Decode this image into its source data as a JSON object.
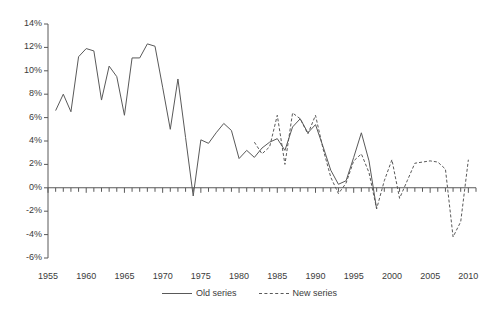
{
  "chart_data": {
    "type": "line",
    "title": "",
    "subtitle": "",
    "xlabel": "",
    "ylabel": "",
    "grid": false,
    "legend_position": "bottom-center",
    "xlim": [
      1955,
      2011
    ],
    "ylim": [
      -6,
      14
    ],
    "y_tick_labels": [
      "14%",
      "12%",
      "10%",
      "8%",
      "6%",
      "4%",
      "2%",
      "0%",
      "-2%",
      "-4%",
      "-6%"
    ],
    "y_tick_values": [
      14,
      12,
      10,
      8,
      6,
      4,
      2,
      0,
      -2,
      -4,
      -6
    ],
    "x_tick_labels": [
      "1955",
      "1960",
      "1965",
      "1970",
      "1975",
      "1980",
      "1985",
      "1990",
      "1995",
      "2000",
      "2005",
      "2010"
    ],
    "x_tick_values": [
      1955,
      1960,
      1965,
      1970,
      1975,
      1980,
      1985,
      1990,
      1995,
      2000,
      2005,
      2010
    ],
    "x_minor_tick_interval": 1,
    "series": [
      {
        "name": "Old series",
        "style": "solid",
        "color": "#595959",
        "x": [
          1956,
          1957,
          1958,
          1959,
          1960,
          1961,
          1962,
          1963,
          1964,
          1965,
          1966,
          1967,
          1968,
          1969,
          1970,
          1971,
          1972,
          1973,
          1974,
          1975,
          1976,
          1977,
          1978,
          1979,
          1980,
          1981,
          1982,
          1983,
          1984,
          1985,
          1986,
          1987,
          1988,
          1989,
          1990,
          1991,
          1992,
          1993,
          1994,
          1995,
          1996,
          1997,
          1998
        ],
        "values": [
          6.6,
          8.0,
          6.5,
          11.2,
          11.9,
          11.7,
          7.5,
          10.4,
          9.5,
          6.2,
          11.1,
          11.1,
          12.3,
          12.1,
          8.6,
          5.0,
          9.3,
          4.3,
          -0.7,
          4.1,
          3.8,
          4.7,
          5.5,
          4.9,
          2.5,
          3.2,
          2.6,
          3.4,
          3.9,
          4.2,
          3.2,
          5.2,
          5.9,
          4.7,
          5.4,
          3.5,
          1.5,
          0.3,
          0.6,
          2.6,
          4.7,
          2.3,
          -1.8
        ]
      },
      {
        "name": "New series",
        "style": "dashed",
        "color": "#595959",
        "x": [
          1982,
          1983,
          1984,
          1985,
          1986,
          1987,
          1988,
          1989,
          1990,
          1991,
          1992,
          1993,
          1994,
          1995,
          1996,
          1997,
          1998,
          1999,
          2000,
          2001,
          2002,
          2003,
          2004,
          2005,
          2006,
          2007,
          2008,
          2009,
          2010
        ],
        "values": [
          3.9,
          2.9,
          3.5,
          6.2,
          2.0,
          6.4,
          5.9,
          4.6,
          6.2,
          3.3,
          0.9,
          -0.5,
          0.4,
          2.3,
          2.9,
          1.3,
          -1.8,
          0.6,
          2.4,
          -0.9,
          0.6,
          2.1,
          2.2,
          2.3,
          2.2,
          1.6,
          -4.2,
          -2.9,
          2.4
        ]
      }
    ]
  }
}
